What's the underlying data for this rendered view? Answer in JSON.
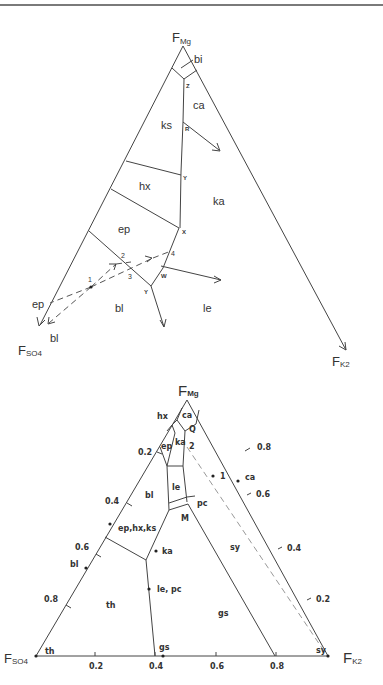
{
  "page": {
    "header_stub": "p"
  },
  "figure_top": {
    "apex_top": {
      "main": "F",
      "sub": "Mg"
    },
    "apex_left": {
      "main": "F",
      "sub": "SO4"
    },
    "apex_right": {
      "main": "F",
      "sub": "K2"
    },
    "fields": {
      "bi": "bi",
      "ca": "ca",
      "ks": "ks",
      "hx": "hx",
      "ka": "ka",
      "ep": "ep",
      "bl": "bl",
      "le": "le",
      "ep_outer": "ep",
      "bl_outer": "bl"
    },
    "points": {
      "Z": "Z",
      "R": "R",
      "Y_upper": "Y",
      "X": "X",
      "W": "W",
      "Y_lower": "Y",
      "p1": "1",
      "p2": "2",
      "p3": "3",
      "p4": "4"
    }
  },
  "figure_bottom": {
    "apex_top": {
      "main": "F",
      "sub": "Mg"
    },
    "apex_left": {
      "main": "F",
      "sub": "SO4"
    },
    "apex_right": {
      "main": "F",
      "sub": "K2"
    },
    "fields": {
      "ca": "ca",
      "hx": "hx",
      "Q": "Q",
      "ep": "ep",
      "ka": "ka",
      "p2": "2",
      "bl": "bl",
      "le": "le",
      "pc": "pc",
      "M": "M",
      "sy": "sy",
      "th": "th",
      "gs": "gs"
    },
    "point_labels": {
      "p1": "1",
      "ca": "ca",
      "ep_hx_ks": "ep,hx,ks",
      "ka": "ka",
      "bl": "bl",
      "le_pc": "le, pc",
      "th": "th",
      "gs": "gs",
      "sy": "sy"
    },
    "left_axis_ticks": [
      "0.2",
      "0.4",
      "0.6",
      "0.8"
    ],
    "right_axis_ticks": [
      "0.8",
      "0.6",
      "0.4",
      "0.2"
    ],
    "bottom_axis_ticks": [
      "0.2",
      "0.4",
      "0.6",
      "0.8"
    ]
  }
}
